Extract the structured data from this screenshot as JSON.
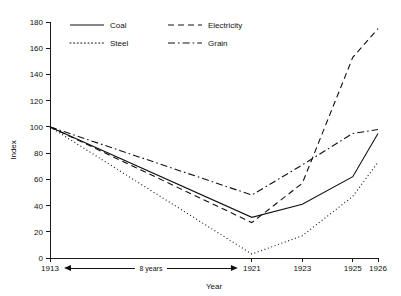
{
  "chart_data": {
    "type": "line",
    "title": "",
    "xlabel": "Year",
    "ylabel": "Index",
    "x": [
      "1913",
      "1921",
      "1923",
      "1925",
      "1926"
    ],
    "x_positions": [
      1913,
      1921,
      1923,
      1925,
      1926
    ],
    "xlim": [
      1913,
      1926
    ],
    "ylim": [
      0,
      180
    ],
    "yticks": [
      0,
      20,
      40,
      60,
      80,
      100,
      120,
      140,
      160,
      180
    ],
    "ytick_labels": [
      "0",
      "20",
      "40",
      "60",
      "80",
      "100",
      "120",
      "140",
      "160",
      "180"
    ],
    "xtick_labels": [
      "1913",
      "1921",
      "1923",
      "1925",
      "1926"
    ],
    "grid": false,
    "legend_position": "top-center",
    "annotations": [
      {
        "name": "eight-years-span",
        "text": "8 years",
        "from": "1913",
        "to": "1921"
      }
    ],
    "series": [
      {
        "name": "Coal",
        "style": "solid",
        "dash": "none",
        "values": [
          100,
          31,
          41,
          62,
          95
        ]
      },
      {
        "name": "Electricity",
        "style": "dashed",
        "dash": "6,4",
        "values": [
          100,
          27,
          57,
          153,
          175
        ]
      },
      {
        "name": "Steel",
        "style": "dotted",
        "dash": "1,2.6",
        "values": [
          100,
          3,
          17,
          47,
          73
        ]
      },
      {
        "name": "Grain",
        "style": "dash-dot",
        "dash": "7,3,1.6,3",
        "values": [
          100,
          48,
          71,
          95,
          98
        ]
      }
    ]
  },
  "legend": {
    "entries": [
      {
        "label": "Coal",
        "style": "solid"
      },
      {
        "label": "Electricity",
        "style": "dashed"
      },
      {
        "label": "Steel",
        "style": "dotted"
      },
      {
        "label": "Grain",
        "style": "dash-dot"
      }
    ]
  },
  "axes": {
    "y_title": "Index",
    "x_title": "Year"
  },
  "colors": {
    "ink": "#111111",
    "background": "#ffffff"
  }
}
